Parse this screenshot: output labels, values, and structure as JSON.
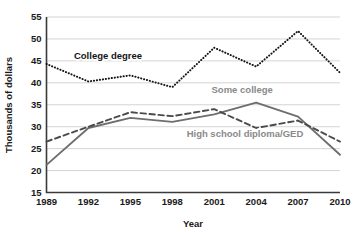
{
  "chart_data": {
    "type": "line",
    "title": "",
    "xlabel": "Year",
    "ylabel": "Thousands of dollars",
    "categories": [
      "1989",
      "1992",
      "1995",
      "1998",
      "2001",
      "2004",
      "2007",
      "2010"
    ],
    "x": [
      1989,
      1992,
      1995,
      1998,
      2001,
      2004,
      2007,
      2010
    ],
    "ylim": [
      15,
      55
    ],
    "yticks": [
      15,
      20,
      25,
      30,
      35,
      40,
      45,
      50,
      55
    ],
    "ytick_labels": [
      "15",
      "20",
      "25",
      "30",
      "35",
      "40",
      "45",
      "50",
      "55"
    ],
    "grid": true,
    "legend_position": "inline-annotations",
    "series": [
      {
        "name": "College degree",
        "style": "dotted",
        "color": "#161616",
        "values": [
          44.3,
          40.3,
          41.7,
          39.0,
          48.0,
          43.7,
          51.8,
          42.3
        ]
      },
      {
        "name": "Some college",
        "style": "solid",
        "color": "#6e6e6e",
        "values": [
          21.3,
          29.7,
          32.0,
          31.1,
          32.8,
          35.5,
          32.3,
          23.6
        ]
      },
      {
        "name": "High school diploma/GED",
        "style": "dashed",
        "color": "#4a4a4a",
        "values": [
          26.6,
          30.0,
          33.3,
          32.4,
          34.0,
          29.7,
          31.4,
          26.6
        ]
      }
    ],
    "annotations": [
      {
        "text": "College degree",
        "x": 1993.4,
        "y": 45.4,
        "color": "#161616"
      },
      {
        "text": "Some college",
        "x": 2003.0,
        "y": 37.6,
        "color": "#8a8a8a"
      },
      {
        "text": "High school diploma/GED",
        "x": 2003.2,
        "y": 27.6,
        "color": "#8a8a8a"
      }
    ]
  },
  "axes": {
    "y_title": "Thousands of dollars",
    "x_title": "Year",
    "y_ticks": [
      "55",
      "50",
      "45",
      "40",
      "35",
      "30",
      "25",
      "20",
      "15"
    ],
    "x_ticks": [
      "1989",
      "1992",
      "1995",
      "1998",
      "2001",
      "2004",
      "2007",
      "2010"
    ]
  },
  "labels": {
    "college_degree": "College degree",
    "some_college": "Some college",
    "high_school": "High school diploma/GED"
  },
  "colors": {
    "college_degree": "#161616",
    "some_college": "#6e6e6e",
    "high_school": "#4a4a4a",
    "grid": "#c9c9c9",
    "axis": "#3a3a3a",
    "background": "#ffffff"
  }
}
